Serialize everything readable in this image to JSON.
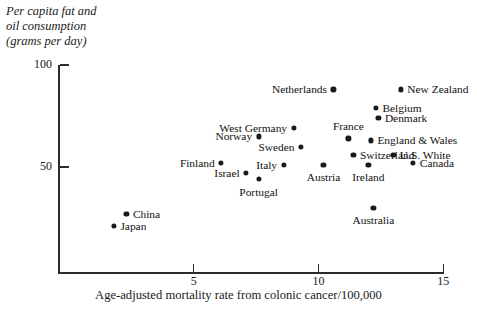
{
  "chart_data": {
    "type": "scatter",
    "title": "",
    "xlabel": "Age-adjusted mortality rate from colonic cancer/100,000",
    "ylabel": "Per capita fat and oil consumption (grams per day)",
    "ylabel_lines": [
      "Per capita fat and",
      "oil consumption",
      "(grams per day)"
    ],
    "xlim": [
      0,
      15.7
    ],
    "ylim": [
      0,
      102
    ],
    "xticks": [
      5,
      10,
      15
    ],
    "xtick_labels": [
      "5",
      "10",
      "15"
    ],
    "yticks": [
      50,
      100
    ],
    "ytick_labels": [
      "50",
      "100"
    ],
    "grid": false,
    "legend": "none",
    "points": [
      {
        "label": "Netherlands",
        "x": 10.6,
        "y": 88,
        "pos": "left"
      },
      {
        "label": "New Zealand",
        "x": 13.3,
        "y": 88,
        "pos": "right"
      },
      {
        "label": "Belgium",
        "x": 12.3,
        "y": 79,
        "pos": "right"
      },
      {
        "label": "Denmark",
        "x": 12.4,
        "y": 74,
        "pos": "right"
      },
      {
        "label": "West Germany",
        "x": 9.0,
        "y": 69,
        "pos": "left"
      },
      {
        "label": "Norway",
        "x": 7.6,
        "y": 65,
        "pos": "left"
      },
      {
        "label": "France",
        "x": 11.2,
        "y": 64,
        "pos": "top"
      },
      {
        "label": "England & Wales",
        "x": 12.1,
        "y": 63,
        "pos": "right"
      },
      {
        "label": "Sweden",
        "x": 9.3,
        "y": 60,
        "pos": "left"
      },
      {
        "label": "Switzerland",
        "x": 11.4,
        "y": 56,
        "pos": "right"
      },
      {
        "label": "U.S. White",
        "x": 13.0,
        "y": 56,
        "pos": "right"
      },
      {
        "label": "Canada",
        "x": 13.8,
        "y": 52,
        "pos": "right"
      },
      {
        "label": "Finland",
        "x": 6.1,
        "y": 52,
        "pos": "left"
      },
      {
        "label": "Italy",
        "x": 8.6,
        "y": 51,
        "pos": "left"
      },
      {
        "label": "Austria",
        "x": 10.2,
        "y": 51,
        "pos": "bottom"
      },
      {
        "label": "Ireland",
        "x": 12.0,
        "y": 51,
        "pos": "bottom"
      },
      {
        "label": "Israel",
        "x": 7.1,
        "y": 47,
        "pos": "left"
      },
      {
        "label": "Portugal",
        "x": 7.6,
        "y": 44,
        "pos": "bottom"
      },
      {
        "label": "Australia",
        "x": 12.2,
        "y": 30,
        "pos": "bottom"
      },
      {
        "label": "China",
        "x": 2.3,
        "y": 27,
        "pos": "right"
      },
      {
        "label": "Japan",
        "x": 1.8,
        "y": 21,
        "pos": "right"
      }
    ]
  }
}
